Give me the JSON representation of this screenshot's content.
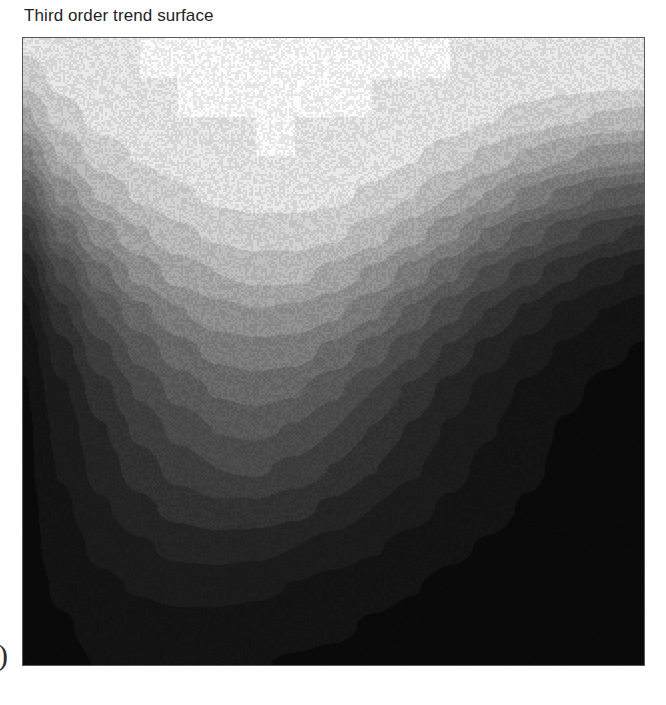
{
  "figure": {
    "title": "Third order trend surface",
    "page_artifact_glyph": ")",
    "background_color": "#ffffff",
    "frame_color": "#58585a"
  },
  "chart_data": {
    "type": "heatmap",
    "subtype": "filled-contour",
    "title": "Third order trend surface",
    "subtitle": "",
    "xlabel": "",
    "ylabel": "",
    "xlim": [
      0,
      1
    ],
    "ylim": [
      0,
      1
    ],
    "xticks": [],
    "yticks": [],
    "xticklabels": [],
    "yticklabels": [],
    "grid": false,
    "legend": "none",
    "colormap": "grayscale",
    "colormap_direction": "high = white, low = black",
    "contour_levels": [
      0,
      0.0667,
      0.1333,
      0.2,
      0.2667,
      0.3333,
      0.4,
      0.4667,
      0.5333,
      0.6,
      0.6667,
      0.7333,
      0.8,
      0.8667,
      0.9333,
      1.0
    ],
    "level_colors": [
      "#0b0b0b",
      "#141414",
      "#1d1d1d",
      "#262626",
      "#333333",
      "#414141",
      "#4f4f4f",
      "#5d5d5d",
      "#6e6e6e",
      "#818181",
      "#969696",
      "#ababab",
      "#c2c2c2",
      "#d8d8d8",
      "#ededed",
      "#ffffff"
    ],
    "surface_model": "third order polynomial trend surface",
    "z_range": [
      0,
      1
    ],
    "features": [
      {
        "name": "ridge-crest",
        "x": 0.48,
        "y": 0.6,
        "z": 1.0,
        "note": "broad white high running across upper part of map"
      },
      {
        "name": "secondary-crest-left",
        "x": 0.2,
        "y": 0.47,
        "z": 0.93,
        "note": "lower shoulder of ridge on left flank"
      },
      {
        "name": "high-right-margin",
        "x": 1.0,
        "y": 0.55,
        "z": 1.0,
        "note": "white reaches right frame edge"
      },
      {
        "name": "central-local-high",
        "x": 0.47,
        "y": 0.3,
        "z": 0.42,
        "note": "faint lighter blob inside dark lower field"
      },
      {
        "name": "low-bottom-left",
        "x": 0.06,
        "y": 0.3,
        "z": 0.02,
        "note": "darkest band hugging left frame"
      },
      {
        "name": "low-bottom-right",
        "x": 0.9,
        "y": 0.1,
        "z": 0.01,
        "note": "dark low in bottom right corner"
      },
      {
        "name": "low-bottom-centre",
        "x": 0.45,
        "y": 0.04,
        "z": 0.03
      }
    ],
    "grid_x": [
      0.0,
      0.0625,
      0.125,
      0.1875,
      0.25,
      0.3125,
      0.375,
      0.4375,
      0.5,
      0.5625,
      0.625,
      0.6875,
      0.75,
      0.8125,
      0.875,
      0.9375,
      1.0
    ],
    "grid_y": [
      0.0,
      0.0625,
      0.125,
      0.1875,
      0.25,
      0.3125,
      0.375,
      0.4375,
      0.5,
      0.5625,
      0.625,
      0.6875,
      0.75,
      0.8125,
      0.875,
      0.9375,
      1.0
    ],
    "z_grid": [
      [
        0.02,
        0.05,
        0.07,
        0.08,
        0.08,
        0.08,
        0.07,
        0.06,
        0.05,
        0.04,
        0.03,
        0.02,
        0.02,
        0.01,
        0.01,
        0.01,
        0.01
      ],
      [
        0.03,
        0.06,
        0.09,
        0.1,
        0.11,
        0.11,
        0.1,
        0.09,
        0.08,
        0.06,
        0.05,
        0.04,
        0.03,
        0.02,
        0.02,
        0.01,
        0.01
      ],
      [
        0.03,
        0.08,
        0.12,
        0.14,
        0.16,
        0.16,
        0.15,
        0.13,
        0.11,
        0.09,
        0.07,
        0.05,
        0.04,
        0.03,
        0.02,
        0.02,
        0.01
      ],
      [
        0.04,
        0.1,
        0.15,
        0.19,
        0.22,
        0.23,
        0.22,
        0.2,
        0.17,
        0.14,
        0.11,
        0.08,
        0.06,
        0.04,
        0.03,
        0.02,
        0.02
      ],
      [
        0.04,
        0.12,
        0.19,
        0.25,
        0.29,
        0.32,
        0.32,
        0.29,
        0.25,
        0.2,
        0.16,
        0.12,
        0.09,
        0.06,
        0.04,
        0.03,
        0.02
      ],
      [
        0.05,
        0.14,
        0.23,
        0.3,
        0.36,
        0.4,
        0.41,
        0.38,
        0.33,
        0.27,
        0.21,
        0.16,
        0.11,
        0.08,
        0.05,
        0.04,
        0.03
      ],
      [
        0.05,
        0.16,
        0.26,
        0.35,
        0.42,
        0.47,
        0.48,
        0.46,
        0.4,
        0.33,
        0.26,
        0.19,
        0.14,
        0.09,
        0.06,
        0.04,
        0.03
      ],
      [
        0.06,
        0.19,
        0.31,
        0.41,
        0.49,
        0.54,
        0.56,
        0.54,
        0.48,
        0.4,
        0.32,
        0.24,
        0.17,
        0.12,
        0.08,
        0.05,
        0.04
      ],
      [
        0.08,
        0.24,
        0.38,
        0.49,
        0.57,
        0.62,
        0.64,
        0.63,
        0.58,
        0.5,
        0.41,
        0.32,
        0.24,
        0.17,
        0.12,
        0.08,
        0.06
      ],
      [
        0.12,
        0.32,
        0.47,
        0.58,
        0.66,
        0.71,
        0.73,
        0.72,
        0.68,
        0.61,
        0.52,
        0.42,
        0.33,
        0.25,
        0.18,
        0.13,
        0.1
      ],
      [
        0.2,
        0.42,
        0.58,
        0.69,
        0.76,
        0.8,
        0.82,
        0.82,
        0.78,
        0.72,
        0.64,
        0.55,
        0.45,
        0.36,
        0.28,
        0.22,
        0.18
      ],
      [
        0.32,
        0.55,
        0.7,
        0.79,
        0.85,
        0.88,
        0.9,
        0.9,
        0.88,
        0.83,
        0.76,
        0.68,
        0.59,
        0.5,
        0.42,
        0.35,
        0.31
      ],
      [
        0.48,
        0.69,
        0.81,
        0.88,
        0.92,
        0.95,
        0.96,
        0.96,
        0.95,
        0.92,
        0.87,
        0.8,
        0.73,
        0.65,
        0.58,
        0.52,
        0.49
      ],
      [
        0.64,
        0.81,
        0.9,
        0.94,
        0.97,
        0.99,
        1.0,
        1.0,
        0.99,
        0.97,
        0.94,
        0.9,
        0.85,
        0.79,
        0.74,
        0.7,
        0.68
      ],
      [
        0.78,
        0.9,
        0.96,
        0.98,
        1.0,
        1.0,
        1.0,
        1.0,
        1.0,
        1.0,
        0.99,
        0.97,
        0.94,
        0.91,
        0.88,
        0.86,
        0.85
      ],
      [
        0.89,
        0.96,
        0.99,
        1.0,
        1.0,
        1.0,
        1.0,
        1.0,
        1.0,
        1.0,
        1.0,
        1.0,
        0.99,
        0.98,
        0.97,
        0.96,
        0.96
      ],
      [
        0.96,
        0.99,
        1.0,
        1.0,
        1.0,
        1.0,
        1.0,
        1.0,
        1.0,
        1.0,
        1.0,
        1.0,
        1.0,
        1.0,
        1.0,
        1.0,
        1.0
      ]
    ]
  }
}
